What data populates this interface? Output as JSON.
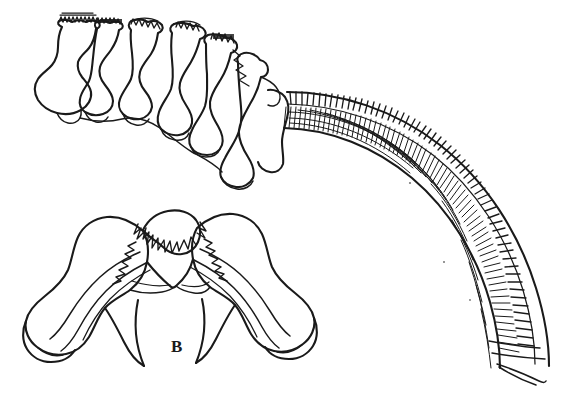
{
  "figure": {
    "background_color": "#ffffff",
    "ink_color": "#1a1a1a",
    "width": 583,
    "height": 393,
    "labels": [
      {
        "id": "label-b",
        "text": "B",
        "x": 171,
        "y": 338
      }
    ],
    "panels": [
      {
        "id": "panel-top",
        "name": "cervical-vertebrae-lateral-series",
        "description": "Lateral view series of articulated vertebrae with neural spines, continuing into a long hatched curved arc",
        "label": ""
      },
      {
        "id": "panel-bottom",
        "name": "vertebra-anterior-view",
        "description": "Anterior/dorsal view of a single vertebra with paired transverse processes",
        "label": "B"
      }
    ],
    "elements": {
      "vertebra_count": 6,
      "arc_segment_count": 58,
      "arc_name": "hatched-curved-arc"
    }
  }
}
